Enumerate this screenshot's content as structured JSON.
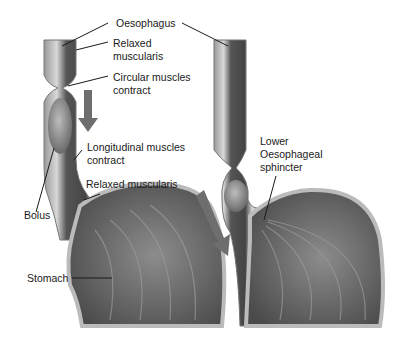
{
  "diagram": {
    "labels": {
      "oesophagus": "Oesophagus",
      "relaxed_muscularis_1a": "Relaxed",
      "relaxed_muscularis_1b": "muscularis",
      "circular_a": "Circular muscles",
      "circular_b": "contract",
      "longitudinal_a": "Longitudinal muscles",
      "longitudinal_b": "contract",
      "relaxed_muscularis_2": "Relaxed muscularis",
      "bolus": "Bolus",
      "stomach": "Stomach",
      "les_a": "Lower",
      "les_b": "Oesophageal",
      "les_c": "sphincter"
    },
    "colors": {
      "tissue_dark": "#4a4a4a",
      "tissue_mid": "#8a8a8a",
      "tissue_light": "#c8c8c8",
      "arrow": "#6e6e6e",
      "leader": "#1a1a1a"
    }
  }
}
